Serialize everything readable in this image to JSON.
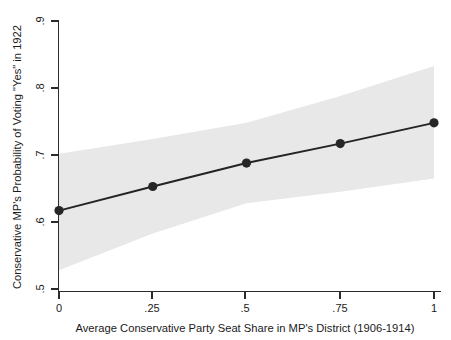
{
  "chart_data": {
    "type": "line",
    "title": "",
    "subtitle": "",
    "xlabel": "Average Conservative Party Seat Share in MP's District (1906-1914)",
    "ylabel": "Conservative MP's Probability of Voting \"Yes\" in 1922",
    "x": [
      0,
      0.25,
      0.5,
      0.75,
      1
    ],
    "xlim": [
      0,
      1
    ],
    "ylim": [
      0.5,
      0.9
    ],
    "xticks": [
      0,
      0.25,
      0.5,
      0.75,
      1
    ],
    "xtick_labels": [
      "0",
      ".25",
      ".5",
      ".75",
      "1"
    ],
    "yticks": [
      0.5,
      0.6,
      0.7,
      0.8,
      0.9
    ],
    "ytick_labels": [
      ".5",
      ".6",
      ".7",
      ".8",
      ".9"
    ],
    "grid": false,
    "legend": "none",
    "series": [
      {
        "name": "Predicted probability",
        "marker": "filled-circle",
        "values": [
          0.617,
          0.653,
          0.688,
          0.717,
          0.748
        ]
      }
    ],
    "confidence_band": {
      "name": "95% confidence interval",
      "fill_color": "#e8e8e8",
      "x": [
        0,
        0.25,
        0.5,
        0.75,
        1
      ],
      "upper": [
        0.702,
        0.724,
        0.748,
        0.788,
        0.833
      ],
      "lower": [
        0.528,
        0.583,
        0.628,
        0.645,
        0.665
      ]
    },
    "colors": {
      "line": "#232323",
      "marker": "#262626",
      "band": "#e8e8e8",
      "axis": "#2b2b2b",
      "background": "#ffffff"
    }
  },
  "axes": {
    "y_title": "Conservative MP's Probability of Voting \"Yes\" in 1922",
    "x_title": "Average Conservative Party Seat Share in MP's District (1906-1914)",
    "y_tick_0": ".5",
    "y_tick_1": ".6",
    "y_tick_2": ".7",
    "y_tick_3": ".8",
    "y_tick_4": ".9",
    "x_tick_0": "0",
    "x_tick_1": ".25",
    "x_tick_2": ".5",
    "x_tick_3": ".75",
    "x_tick_4": "1"
  }
}
